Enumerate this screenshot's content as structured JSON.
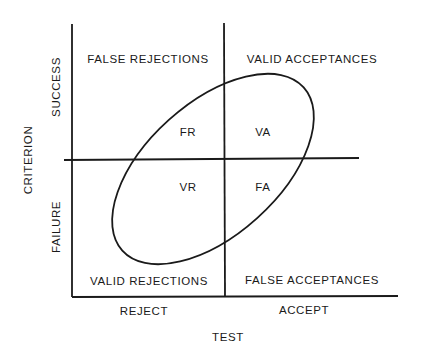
{
  "quadrants": {
    "top_left": "FALSE REJECTIONS",
    "top_right": "VALID ACCEPTANCES",
    "bottom_left": "VALID REJECTIONS",
    "bottom_right": "FALSE ACCEPTANCES"
  },
  "cells": {
    "fr": "FR",
    "va": "VA",
    "vr": "VR",
    "fa": "FA"
  },
  "y_axis": {
    "title": "CRITERION",
    "upper": "SUCCESS",
    "lower": "FAILURE"
  },
  "x_axis": {
    "title": "TEST",
    "left": "REJECT",
    "right": "ACCEPT"
  }
}
